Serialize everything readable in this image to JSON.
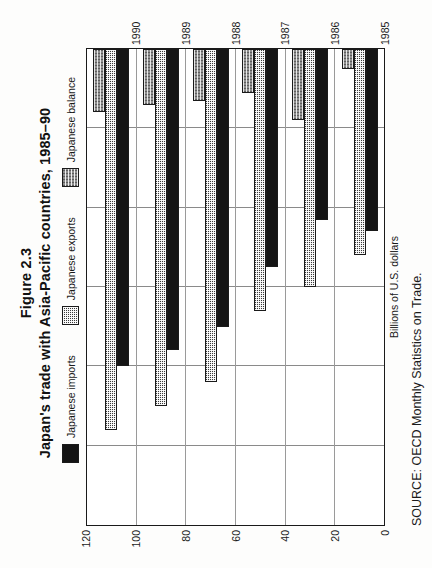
{
  "figure": {
    "number": "Figure 2.3",
    "title": "Japan's trade with Asia-Pacific countries, 1985–90",
    "source": "SOURCE: OECD Monthly Statistics on Trade."
  },
  "legend": {
    "items": [
      {
        "label": "Japanese imports",
        "swatch": "solid-black"
      },
      {
        "label": "Japanese exports",
        "swatch": "fine-dot-dark"
      },
      {
        "label": "Japanese balance",
        "swatch": "coarse-checker-gray"
      }
    ]
  },
  "axis": {
    "value_title": "Billions of U.S. dollars",
    "ticks": [
      "120",
      "100",
      "80",
      "60",
      "40",
      "20",
      "0"
    ],
    "category_ticks": [
      "1990",
      "1989",
      "1988",
      "1987",
      "1986",
      "1985"
    ]
  },
  "chart_data": {
    "type": "bar",
    "orientation": "horizontal",
    "title": "Japan's trade with Asia-Pacific countries, 1985–90",
    "xlabel": "Billions of U.S. dollars",
    "ylabel": "",
    "xlim": [
      0,
      120
    ],
    "grid": true,
    "legend_position": "top",
    "categories": [
      "1990",
      "1989",
      "1988",
      "1987",
      "1986",
      "1985"
    ],
    "series": [
      {
        "name": "Japanese balance",
        "values": [
          16,
          14,
          13,
          11,
          18,
          5
        ]
      },
      {
        "name": "Japanese exports",
        "values": [
          96,
          90,
          84,
          66,
          60,
          52
        ]
      },
      {
        "name": "Japanese imports",
        "values": [
          80,
          76,
          70,
          55,
          43,
          46
        ]
      }
    ]
  }
}
